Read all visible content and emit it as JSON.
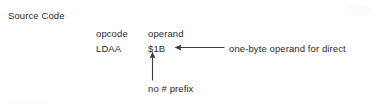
{
  "diagram": {
    "section_title": "Source Code",
    "columns": {
      "opcode_header": "opcode",
      "operand_header": "operand"
    },
    "instruction": {
      "mnemonic": "LDAA",
      "operand": "$1B"
    },
    "annotations": {
      "right_callout": "one-byte operand for direct",
      "bottom_callout": "no # prefix"
    },
    "arrows": {
      "right_arrow": "leftward-arrow",
      "bottom_arrow": "upward-arrow"
    },
    "colors": {
      "ink": "#2b2b2b",
      "background": "#ffffff",
      "arrow": "#3a3a3a"
    }
  }
}
